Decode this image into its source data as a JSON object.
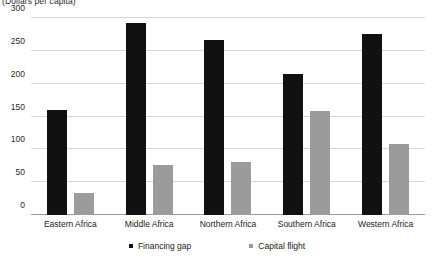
{
  "chart_data": {
    "type": "bar",
    "title": "",
    "subtitle": "(Dollars per capita)",
    "xlabel": "",
    "ylabel": "",
    "ylim": [
      0,
      300
    ],
    "yticks": [
      0,
      50,
      100,
      150,
      200,
      250,
      300
    ],
    "ytick_labels": [
      "0",
      "50",
      "100",
      "150",
      "200",
      "250",
      "300"
    ],
    "grid": true,
    "legend_position": "bottom",
    "categories": [
      "Eastern Africa",
      "Middle Africa",
      "Northern Africa",
      "Southern Africa",
      "Western Africa"
    ],
    "series": [
      {
        "name": "Financing gap",
        "color": "#111111",
        "values": [
          160,
          292,
          267,
          215,
          275
        ]
      },
      {
        "name": "Capital flight",
        "color": "#9b9b9b",
        "values": [
          33,
          76,
          80,
          159,
          108
        ]
      }
    ]
  }
}
